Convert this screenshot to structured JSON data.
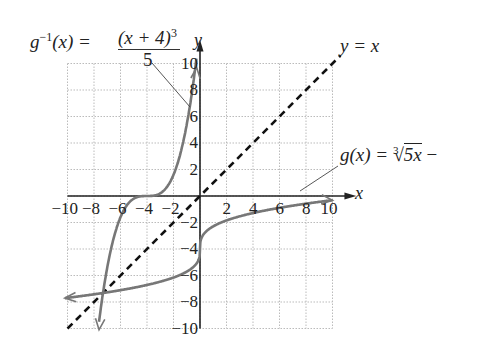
{
  "chart_data": {
    "type": "line",
    "title": "",
    "xlabel": "x",
    "ylabel": "y",
    "xlim": [
      -10,
      10
    ],
    "ylim": [
      -10,
      10
    ],
    "grid": true,
    "x_ticks": [
      -10,
      -8,
      -6,
      -4,
      -2,
      2,
      4,
      6,
      8,
      10
    ],
    "y_ticks": [
      10,
      8,
      6,
      4,
      2,
      -2,
      -4,
      -6,
      -8,
      -10
    ],
    "series": [
      {
        "name": "g^{-1}(x) = (x + 4)^3 / 5",
        "style": "solid gray",
        "x": [
          -7.6,
          -6,
          -5,
          -4,
          -3,
          -2,
          -1,
          -0.3
        ],
        "y": [
          -10,
          -1.6,
          -0.2,
          0,
          0.2,
          1.6,
          5.4,
          9.6
        ]
      },
      {
        "name": "g(x) = ∛(5x) − 4",
        "style": "solid gray",
        "x": [
          -10,
          -8,
          -6,
          -4,
          -2,
          -0.5,
          0,
          0.5,
          2,
          4,
          6,
          8,
          10
        ],
        "y": [
          -7.68,
          -7.42,
          -7.11,
          -6.71,
          -6.15,
          -5.36,
          -4,
          -2.64,
          -1.85,
          -1.29,
          -0.89,
          -0.58,
          -0.32
        ]
      },
      {
        "name": "y = x",
        "style": "dashed black",
        "x": [
          -10,
          10
        ],
        "y": [
          -10,
          10
        ]
      }
    ],
    "annotations": [
      "g^{-1}(x) = (x + 4)^3 / 5",
      "y = x",
      "g(x) = ∛5x −"
    ]
  },
  "labels": {
    "ginv_lhs": "g",
    "ginv_sup": "−1",
    "ginv_arg": "(x) =",
    "ginv_num": "(x + 4)",
    "ginv_num_sup": "3",
    "ginv_den": "5",
    "yx": "y = x",
    "g_lhs": "g(x) =",
    "g_root_index": "3",
    "g_radicand": "5x",
    "g_tail": "−",
    "x_axis": "x",
    "y_axis": "y"
  },
  "ticks": {
    "x": [
      "−10",
      "−8",
      "−6",
      "−4",
      "−2",
      "2",
      "4",
      "6",
      "8",
      "10"
    ],
    "y": [
      "10",
      "8",
      "6",
      "4",
      "2",
      "−2",
      "−4",
      "−6",
      "−8",
      "−10"
    ]
  }
}
